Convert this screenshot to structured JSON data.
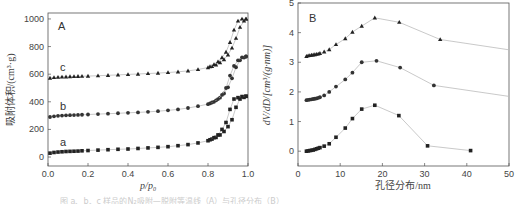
{
  "chart_data": [
    {
      "type": "scatter",
      "panel_label": "A",
      "title": "",
      "xlabel": "p/p0",
      "ylabel": "吸附体积/(cm³·g)",
      "xlim": [
        0.0,
        1.0
      ],
      "ylim": [
        -65,
        1043
      ],
      "xticks": [
        "0.0",
        "0.2",
        "0.4",
        "0.6",
        "0.8",
        "1.0"
      ],
      "yticks": [
        "0",
        "200",
        "400",
        "600",
        "800",
        "1000"
      ],
      "grid": false,
      "series": [
        {
          "name": "a",
          "marker": "square",
          "adsorption": {
            "x": [
              0.01,
              0.03,
              0.05,
              0.07,
              0.09,
              0.11,
              0.13,
              0.15,
              0.17,
              0.2,
              0.25,
              0.3,
              0.35,
              0.4,
              0.45,
              0.5,
              0.55,
              0.6,
              0.65,
              0.7,
              0.75,
              0.8,
              0.82,
              0.84,
              0.86,
              0.88,
              0.9,
              0.92,
              0.94,
              0.96,
              0.98,
              0.99
            ],
            "y": [
              28,
              33,
              36,
              38,
              40,
              41,
              42,
              43,
              45,
              47,
              50,
              53,
              56,
              58,
              62,
              66,
              70,
              75,
              82,
              90,
              102,
              118,
              130,
              142,
              160,
              185,
              220,
              270,
              360,
              420,
              432,
              440
            ]
          },
          "desorption": {
            "x": [
              0.99,
              0.97,
              0.95,
              0.93,
              0.91,
              0.89,
              0.87,
              0.85,
              0.83,
              0.81
            ],
            "y": [
              440,
              438,
              430,
              420,
              345,
              250,
              200,
              160,
              140,
              125
            ]
          }
        },
        {
          "name": "b",
          "marker": "circle",
          "adsorption": {
            "x": [
              0.01,
              0.03,
              0.05,
              0.07,
              0.09,
              0.11,
              0.13,
              0.15,
              0.17,
              0.2,
              0.25,
              0.3,
              0.35,
              0.4,
              0.45,
              0.5,
              0.55,
              0.6,
              0.65,
              0.7,
              0.75,
              0.8,
              0.82,
              0.84,
              0.86,
              0.88,
              0.9,
              0.92,
              0.94,
              0.96,
              0.98,
              0.99
            ],
            "y": [
              290,
              295,
              298,
              300,
              302,
              303,
              304,
              305,
              306,
              308,
              311,
              314,
              317,
              320,
              323,
              327,
              332,
              338,
              345,
              355,
              368,
              383,
              395,
              410,
              430,
              460,
              505,
              570,
              650,
              700,
              720,
              728
            ]
          },
          "desorption": {
            "x": [
              0.99,
              0.97,
              0.95,
              0.93,
              0.91,
              0.89,
              0.87,
              0.85,
              0.83,
              0.81
            ],
            "y": [
              728,
              722,
              700,
              660,
              590,
              500,
              450,
              420,
              400,
              388
            ]
          }
        },
        {
          "name": "c",
          "marker": "triangle",
          "adsorption": {
            "x": [
              0.01,
              0.03,
              0.05,
              0.07,
              0.09,
              0.11,
              0.13,
              0.15,
              0.17,
              0.2,
              0.25,
              0.3,
              0.35,
              0.4,
              0.45,
              0.5,
              0.55,
              0.6,
              0.65,
              0.7,
              0.75,
              0.8,
              0.82,
              0.84,
              0.86,
              0.88,
              0.9,
              0.92,
              0.94,
              0.96,
              0.98,
              0.99
            ],
            "y": [
              572,
              576,
              578,
              580,
              581,
              582,
              583,
              584,
              585,
              586,
              589,
              592,
              595,
              598,
              601,
              605,
              608,
              612,
              617,
              624,
              634,
              648,
              656,
              668,
              684,
              706,
              740,
              790,
              860,
              940,
              985,
              1000
            ]
          },
          "desorption": {
            "x": [
              0.99,
              0.97,
              0.95,
              0.93,
              0.91,
              0.89,
              0.87,
              0.85,
              0.83,
              0.81
            ],
            "y": [
              1000,
              1000,
              985,
              920,
              830,
              760,
              720,
              690,
              670,
              655
            ]
          }
        }
      ],
      "annotations": [
        {
          "text": "a",
          "x": 0.04,
          "y": 80
        },
        {
          "text": "b",
          "x": 0.04,
          "y": 340
        },
        {
          "text": "c",
          "x": 0.04,
          "y": 625
        }
      ]
    },
    {
      "type": "line",
      "panel_label": "B",
      "title": "",
      "xlabel": "孔径分布/nm",
      "ylabel": "dV/dD/[cm³/(g·nm)]",
      "xlim": [
        0,
        50
      ],
      "ylim": [
        -0.5,
        5
      ],
      "xticks": [
        "0",
        "10",
        "20",
        "30",
        "40",
        "50"
      ],
      "yticks": [
        "0",
        "1",
        "2",
        "3",
        "4",
        "5"
      ],
      "grid": false,
      "series": [
        {
          "name": "a",
          "marker": "square",
          "x": [
            2.0,
            2.4,
            2.8,
            3.2,
            3.6,
            4.0,
            4.4,
            4.8,
            5.2,
            6.2,
            7.4,
            9.0,
            11.2,
            12.9,
            15.1,
            18.2,
            23.9,
            30.7,
            40.9
          ],
          "y": [
            0.0,
            0.01,
            0.02,
            0.03,
            0.04,
            0.06,
            0.08,
            0.1,
            0.12,
            0.17,
            0.25,
            0.47,
            0.78,
            1.1,
            1.42,
            1.55,
            1.2,
            0.18,
            0.02
          ]
        },
        {
          "name": "b",
          "marker": "circle",
          "x": [
            2.0,
            2.4,
            2.8,
            3.2,
            3.6,
            4.0,
            4.4,
            4.8,
            5.2,
            6.2,
            7.4,
            9.0,
            11.2,
            12.9,
            15.1,
            18.6,
            24.2,
            32.2,
            50.0
          ],
          "y": [
            1.72,
            1.73,
            1.74,
            1.75,
            1.76,
            1.77,
            1.78,
            1.8,
            1.82,
            1.88,
            2.0,
            2.18,
            2.42,
            2.65,
            3.0,
            3.05,
            2.82,
            2.22,
            1.85
          ],
          "last_point_marker": false
        },
        {
          "name": "c",
          "marker": "triangle",
          "x": [
            2.0,
            2.4,
            2.8,
            3.2,
            3.6,
            4.0,
            4.4,
            4.8,
            5.2,
            6.2,
            7.4,
            9.0,
            11.2,
            12.9,
            15.1,
            18.2,
            24.0,
            33.7,
            50.0
          ],
          "y": [
            3.2,
            3.22,
            3.23,
            3.24,
            3.25,
            3.26,
            3.27,
            3.28,
            3.3,
            3.35,
            3.43,
            3.6,
            3.8,
            4.02,
            4.22,
            4.5,
            4.35,
            3.77,
            3.42
          ],
          "last_point_marker": false
        }
      ]
    }
  ],
  "caption": "图  a、b、c 样品的N₂吸附—脱附等温线（A）与孔径分布（B）"
}
